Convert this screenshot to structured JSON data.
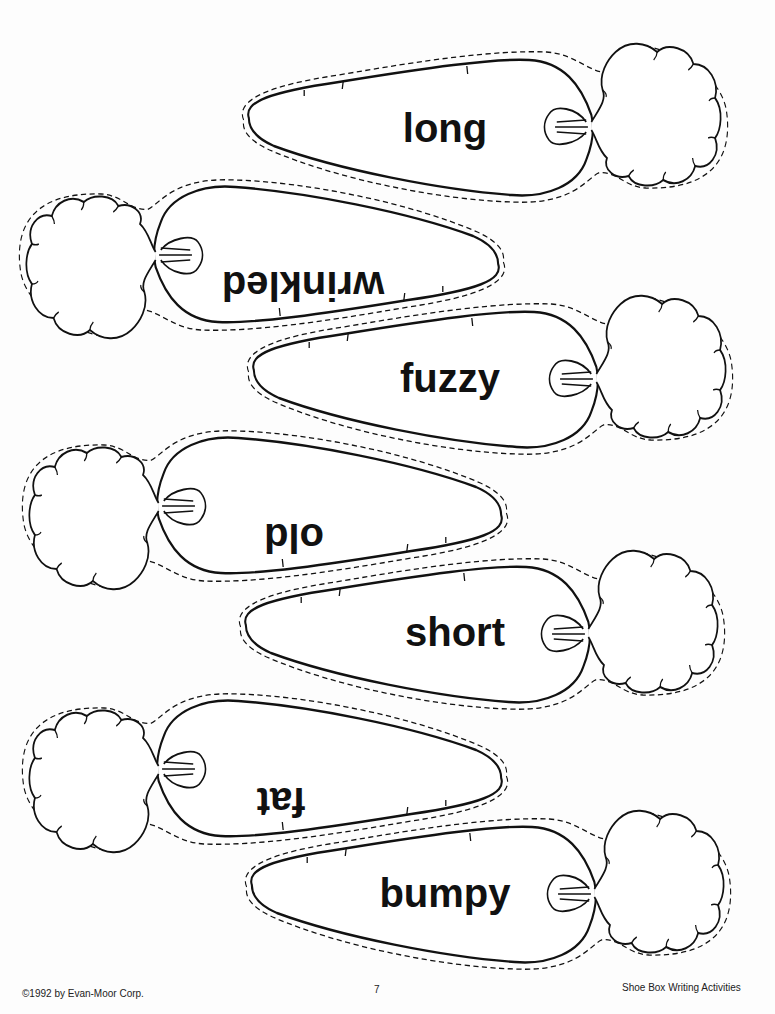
{
  "worksheet": {
    "title": "Carrot word cards",
    "cards": [
      {
        "word": "long",
        "orientation": "right",
        "upside_down": false
      },
      {
        "word": "wrinkled",
        "orientation": "left",
        "upside_down": true
      },
      {
        "word": "fuzzy",
        "orientation": "right",
        "upside_down": false
      },
      {
        "word": "old",
        "orientation": "left",
        "upside_down": true
      },
      {
        "word": "short",
        "orientation": "right",
        "upside_down": false
      },
      {
        "word": "fat",
        "orientation": "left",
        "upside_down": true
      },
      {
        "word": "bumpy",
        "orientation": "right",
        "upside_down": false
      }
    ],
    "cut_line_style": "dashed",
    "outline_color": "#111111"
  },
  "footer": {
    "copyright": "©1992 by Evan-Moor Corp.",
    "page_number": "7",
    "book_title": "Shoe Box Writing Activities"
  }
}
